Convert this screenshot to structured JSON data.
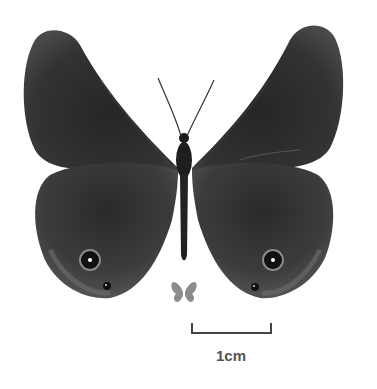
{
  "image": {
    "subject": "butterfly specimen, dorsal view",
    "colors": {
      "background": "#ffffff",
      "wing_dark": "#2e2e2e",
      "wing_mid": "#4a4a4a",
      "wing_edge": "#6a6a6a",
      "body": "#1e1e1e",
      "eyespot_ring": "#8a8a8a",
      "eyespot_pupil": "#ffffff",
      "icon_gray": "#8c8c8c",
      "scale_bar": "#444444"
    }
  },
  "scale_bar": {
    "label": "1cm"
  },
  "size_icon": {
    "name": "butterfly-size-icon"
  }
}
